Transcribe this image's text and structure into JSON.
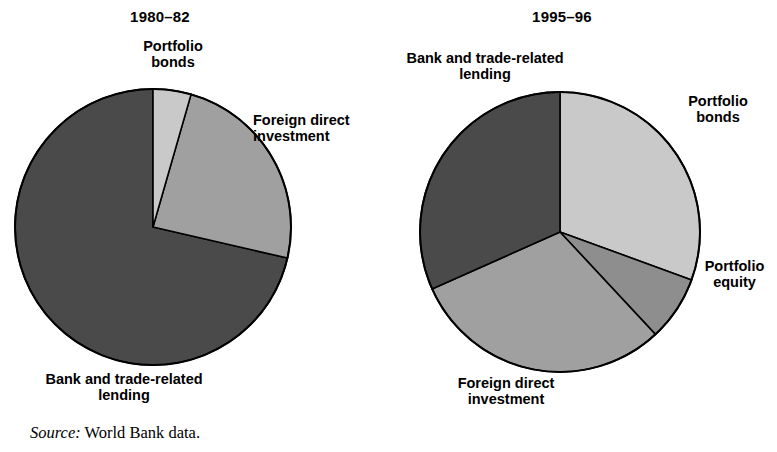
{
  "figure": {
    "source_label": "Source:",
    "source_text": "World Bank data."
  },
  "charts": [
    {
      "id": "left",
      "title": "1980–82",
      "labels": {
        "bonds": "Portfolio\nbonds",
        "fdi": "Foreign direct\ninvestment",
        "bank": "Bank and trade-related\nlending"
      }
    },
    {
      "id": "right",
      "title": "1995–96",
      "labels": {
        "bank": "Bank and trade-related\nlending",
        "bonds": "Portfolio\nbonds",
        "equity": "Portfolio\nequity",
        "fdi": "Foreign direct\ninvestment"
      }
    }
  ],
  "colors": {
    "bonds": "#c9c9c9",
    "equity": "#8e8e8e",
    "fdi": "#a0a0a0",
    "bank": "#4a4a4a",
    "outline": "#000000",
    "background": "#ffffff",
    "text": "#000000"
  },
  "chart_data": [
    {
      "type": "pie",
      "title": "1980–82",
      "categories": [
        "Portfolio bonds",
        "Foreign direct investment",
        "Bank and trade-related lending"
      ],
      "values": [
        4.4,
        24.2,
        71.4
      ],
      "unit": "percent of total private capital flows",
      "start_angle_deg": 0,
      "direction": "clockwise",
      "legend": "none (labels placed around pie)",
      "slice_angles_deg": [
        {
          "name": "Portfolio bonds",
          "from": 0,
          "to": 16
        },
        {
          "name": "Foreign direct investment",
          "from": 16,
          "to": 103
        },
        {
          "name": "Bank and trade-related lending",
          "from": 103,
          "to": 360
        }
      ]
    },
    {
      "type": "pie",
      "title": "1995–96",
      "categories": [
        "Portfolio bonds",
        "Portfolio equity",
        "Foreign direct investment",
        "Bank and trade-related lending"
      ],
      "values": [
        30.5,
        7.5,
        30.3,
        31.7
      ],
      "unit": "percent of total private capital flows",
      "start_angle_deg": 0,
      "direction": "clockwise",
      "legend": "none (labels placed around pie)",
      "slice_angles_deg": [
        {
          "name": "Portfolio bonds",
          "from": 0,
          "to": 110
        },
        {
          "name": "Portfolio equity",
          "from": 110,
          "to": 137
        },
        {
          "name": "Foreign direct investment",
          "from": 137,
          "to": 246
        },
        {
          "name": "Bank and trade-related lending",
          "from": 246,
          "to": 360
        }
      ]
    }
  ]
}
